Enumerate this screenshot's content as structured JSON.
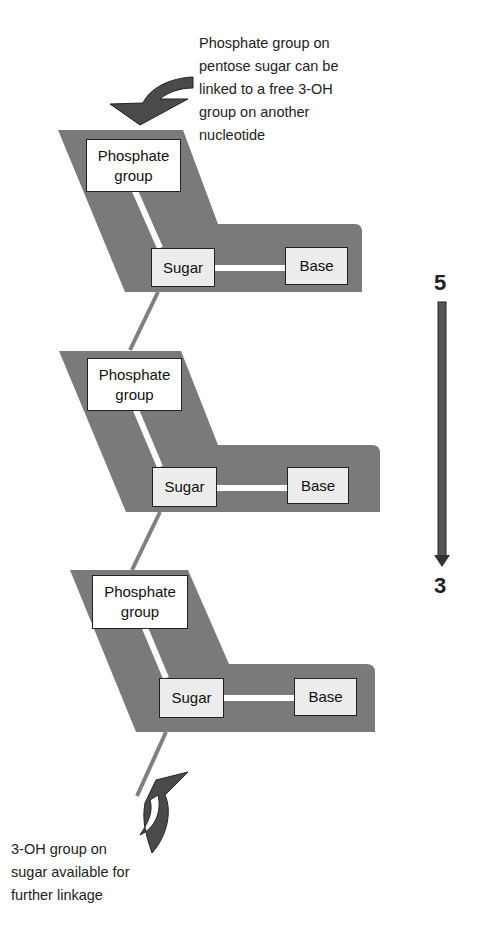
{
  "colors": {
    "backbone_fill": "#7a7a7a",
    "arrow_fill": "#4a4a4a",
    "bond_line": "#ffffff",
    "link_line": "#808080",
    "box_fill_phosphate": "#ffffff",
    "box_fill_sugar_base": "#ececec"
  },
  "annotations": {
    "top": {
      "lines": [
        "Phosphate group on",
        "pentose sugar can be",
        "linked to a free 3-OH",
        "group on another",
        "nucleotide"
      ]
    },
    "bottom": {
      "lines": [
        "3-OH group on",
        "sugar available for",
        "further linkage"
      ]
    }
  },
  "direction": {
    "start_label": "5",
    "end_label": "3"
  },
  "nucleotides": [
    {
      "phosphate": [
        "Phosphate",
        "group"
      ],
      "sugar": "Sugar",
      "base": "Base"
    },
    {
      "phosphate": [
        "Phosphate",
        "group"
      ],
      "sugar": "Sugar",
      "base": "Base"
    },
    {
      "phosphate": [
        "Phosphate",
        "group"
      ],
      "sugar": "Sugar",
      "base": "Base"
    }
  ]
}
